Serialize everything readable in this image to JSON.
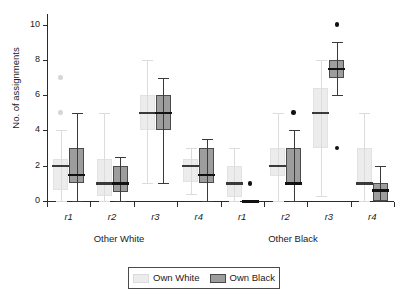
{
  "chart_data": {
    "type": "box",
    "title": "",
    "xlabel": "",
    "ylabel": "No. of assignments",
    "ylim": [
      0,
      10.6
    ],
    "yticks": [
      0,
      2,
      4,
      6,
      8,
      10
    ],
    "ytick_labels": [
      "0",
      "2",
      "4",
      "6",
      "8",
      "10"
    ],
    "grid": false,
    "legend_position": "bottom-center",
    "legend": [
      "Own White",
      "Own Black"
    ],
    "group_labels": [
      "Other White",
      "Other Black"
    ],
    "categories": [
      "r1",
      "r2",
      "r3",
      "r4",
      "r1",
      "r2",
      "r3",
      "r4"
    ],
    "series": [
      {
        "name": "Own White",
        "color": "#ececec",
        "boxes": [
          {
            "group": "Other White",
            "category": "r1",
            "min": 0.0,
            "q1": 0.6,
            "median": 2.0,
            "q3": 2.4,
            "max": 4.0,
            "outliers": [
              5.0,
              7.0
            ]
          },
          {
            "group": "Other White",
            "category": "r2",
            "min": 0.0,
            "q1": 0.3,
            "median": 1.0,
            "q3": 2.4,
            "max": 5.0,
            "outliers": []
          },
          {
            "group": "Other White",
            "category": "r3",
            "min": 1.0,
            "q1": 4.0,
            "median": 5.0,
            "q3": 6.0,
            "max": 8.0,
            "outliers": []
          },
          {
            "group": "Other White",
            "category": "r4",
            "min": 0.4,
            "q1": 1.1,
            "median": 2.0,
            "q3": 2.4,
            "max": 3.0,
            "outliers": []
          },
          {
            "group": "Other Black",
            "category": "r1",
            "min": 0.0,
            "q1": 0.2,
            "median": 1.0,
            "q3": 2.0,
            "max": 3.0,
            "outliers": []
          },
          {
            "group": "Other Black",
            "category": "r2",
            "min": 0.0,
            "q1": 1.4,
            "median": 2.0,
            "q3": 3.0,
            "max": 5.0,
            "outliers": []
          },
          {
            "group": "Other Black",
            "category": "r3",
            "min": 0.3,
            "q1": 3.0,
            "median": 5.0,
            "q3": 6.4,
            "max": 8.0,
            "outliers": []
          },
          {
            "group": "Other Black",
            "category": "r4",
            "min": 0.0,
            "q1": 0.9,
            "median": 1.0,
            "q3": 3.0,
            "max": 5.0,
            "outliers": []
          }
        ]
      },
      {
        "name": "Own Black",
        "color": "#9d9d9d",
        "boxes": [
          {
            "group": "Other White",
            "category": "r1",
            "min": 0.0,
            "q1": 1.0,
            "median": 1.5,
            "q3": 3.0,
            "max": 5.0,
            "outliers": []
          },
          {
            "group": "Other White",
            "category": "r2",
            "min": 0.0,
            "q1": 0.5,
            "median": 1.0,
            "q3": 2.0,
            "max": 2.5,
            "outliers": []
          },
          {
            "group": "Other White",
            "category": "r3",
            "min": 1.0,
            "q1": 4.0,
            "median": 5.0,
            "q3": 6.0,
            "max": 7.0,
            "outliers": []
          },
          {
            "group": "Other White",
            "category": "r4",
            "min": 0.0,
            "q1": 1.0,
            "median": 1.5,
            "q3": 3.0,
            "max": 3.5,
            "outliers": []
          },
          {
            "group": "Other Black",
            "category": "r1",
            "min": 0.0,
            "q1": 0.0,
            "median": 0.0,
            "q3": 0.0,
            "max": 0.0,
            "outliers": [
              1.0
            ]
          },
          {
            "group": "Other Black",
            "category": "r2",
            "min": 0.0,
            "q1": 1.0,
            "median": 1.0,
            "q3": 3.0,
            "max": 4.0,
            "outliers": [
              5.0
            ]
          },
          {
            "group": "Other Black",
            "category": "r3",
            "min": 6.0,
            "q1": 7.0,
            "median": 7.5,
            "q3": 8.0,
            "max": 9.0,
            "outliers": [
              10.0,
              3.0
            ]
          },
          {
            "group": "Other Black",
            "category": "r4",
            "min": 0.0,
            "q1": 0.0,
            "median": 0.6,
            "q3": 1.0,
            "max": 2.0,
            "outliers": []
          }
        ]
      }
    ]
  },
  "axes": {
    "y_title": "No. of assignments"
  },
  "legend": {
    "own_white_label": "Own White",
    "own_black_label": "Own Black"
  },
  "xaxis": {
    "ticks": [
      "r1",
      "r2",
      "r3",
      "r4",
      "r1",
      "r2",
      "r3",
      "r4"
    ],
    "group_left": "Other White",
    "group_right": "Other Black"
  },
  "yaxis": {
    "labels": [
      "10",
      "8",
      "6",
      "4",
      "2",
      "0"
    ]
  }
}
